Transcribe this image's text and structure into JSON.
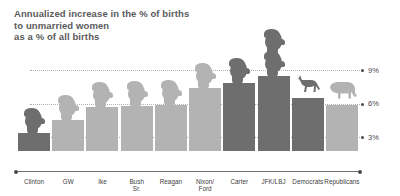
{
  "title": {
    "line1": "Annualized increase in the % of births",
    "line2": "to unmarried women",
    "line3": "as a % of all births"
  },
  "colors": {
    "democrat": "#6e6e6e",
    "republican": "#b3b3b3",
    "axis": "#6f6f6f",
    "grid": "#b0b0b0",
    "title_text": "#5a5a5a",
    "label_text": "#3d3d3d"
  },
  "axis": {
    "ticks": [
      {
        "label": "9%",
        "value": 9
      },
      {
        "label": "6%",
        "value": 6
      },
      {
        "label": "3%",
        "value": 3
      }
    ]
  },
  "chart_data": {
    "type": "bar",
    "title": "Annualized increase in the % of births to unmarried women as a % of all births",
    "xlabel": "",
    "ylabel": "",
    "ylim": [
      0,
      10
    ],
    "grid": true,
    "legend": "none",
    "categories": [
      "Clinton",
      "GW",
      "Ike",
      "Bush Sr.",
      "Reagan",
      "Nixon/ Ford",
      "Carter",
      "JFK/LBJ",
      "Democrats",
      "Republicans"
    ],
    "values": [
      1.6,
      2.8,
      3.9,
      4.0,
      4.1,
      5.6,
      6.1,
      6.7,
      4.7,
      4.1
    ],
    "party": [
      "democrat",
      "republican",
      "republican",
      "republican",
      "republican",
      "republican",
      "democrat",
      "democrat",
      "democrat",
      "republican"
    ],
    "icons": [
      "head-icon",
      "head-icon",
      "head-icon",
      "head-icon",
      "head-icon",
      "head-icon",
      "head-icon",
      "double-head-icon",
      "donkey-icon",
      "elephant-icon"
    ]
  }
}
